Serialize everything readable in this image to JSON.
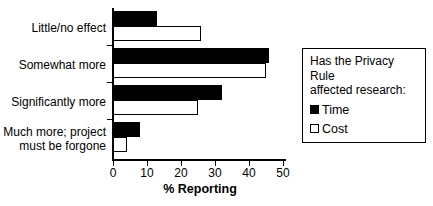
{
  "chart_data": {
    "type": "bar",
    "orientation": "horizontal",
    "title": "",
    "xlabel": "% Reporting",
    "ylabel": "",
    "xlim": [
      0,
      50
    ],
    "xticks": [
      0,
      10,
      20,
      30,
      40,
      50
    ],
    "xtick_labels": [
      "0",
      "10",
      "20",
      "30",
      "40",
      "50"
    ],
    "grid": false,
    "legend_position": "right",
    "legend_title": "Has the Privacy Rule\naffected research:",
    "categories": [
      "Little/no effect",
      "Somewhat more",
      "Significantly more",
      "Much more; project\nmust be forgone"
    ],
    "series": [
      {
        "name": "Time",
        "style": "filled",
        "color": "#000000",
        "values": [
          13,
          46,
          32,
          8
        ]
      },
      {
        "name": "Cost",
        "style": "hollow",
        "color": "#ffffff",
        "values": [
          26,
          45,
          25,
          4
        ]
      }
    ]
  },
  "legend": {
    "title_line1": "Has the Privacy Rule",
    "title_line2": "affected research:",
    "items": [
      {
        "label": "Time",
        "swatch": "filled-square-icon"
      },
      {
        "label": "Cost",
        "swatch": "hollow-square-icon"
      }
    ]
  },
  "axis": {
    "x_title": "% Reporting",
    "tick_0": "0",
    "tick_1": "10",
    "tick_2": "20",
    "tick_3": "30",
    "tick_4": "40",
    "tick_5": "50"
  },
  "categories": {
    "c0_line1": "Little/no effect",
    "c1_line1": "Somewhat more",
    "c2_line1": "Significantly more",
    "c3_line1": "Much more; project",
    "c3_line2": "must be forgone"
  }
}
